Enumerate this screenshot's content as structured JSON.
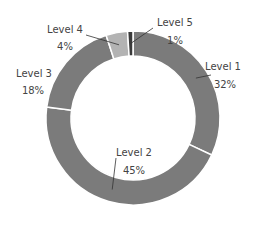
{
  "chart_data": {
    "type": "pie",
    "subtype": "donut",
    "title": "",
    "categories": [
      "Level 1",
      "Level 2",
      "Level 3",
      "Level 4",
      "Level 5"
    ],
    "values": [
      32,
      45,
      18,
      4,
      1
    ],
    "labels": [
      {
        "name": "Level 1",
        "pct": "32%"
      },
      {
        "name": "Level 2",
        "pct": "45%"
      },
      {
        "name": "Level 3",
        "pct": "18%"
      },
      {
        "name": "Level 4",
        "pct": "4%"
      },
      {
        "name": "Level 5",
        "pct": "1%"
      }
    ],
    "colors": [
      "#7b7b7b",
      "#7b7b7b",
      "#7b7b7b",
      "#b3b3b3",
      "#3a3a3a"
    ],
    "start_angle": "top",
    "direction": "clockwise",
    "legend": "none"
  }
}
